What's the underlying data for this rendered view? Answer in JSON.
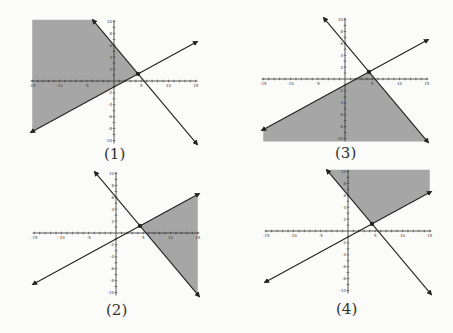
{
  "figure": {
    "graphs": [
      {
        "id": 1,
        "label": "(1)",
        "shaded_region": "left of descending line and above ascending line",
        "shade_color": "#a6a6a6"
      },
      {
        "id": 2,
        "label": "(2)",
        "shaded_region": "right of descending line and below ascending line (bounded by x=15)",
        "shade_color": "#a6a6a6"
      },
      {
        "id": 3,
        "label": "(3)",
        "shaded_region": "below both lines",
        "shade_color": "#a6a6a6"
      },
      {
        "id": 4,
        "label": "(4)",
        "shaded_region": "above both lines",
        "shade_color": "#a6a6a6"
      }
    ],
    "axes": {
      "x_ticks": [
        "-15",
        "-10",
        "-5",
        "5",
        "10",
        "15"
      ],
      "y_ticks": [
        "10",
        "8",
        "6",
        "4",
        "2",
        "-2",
        "-4",
        "-6",
        "-8",
        "-10"
      ],
      "xlim": [
        -15,
        15
      ],
      "ylim": [
        -10,
        10
      ]
    },
    "lines": [
      {
        "name": "descending",
        "y_intercept": 6,
        "x_intercept": 5.5
      },
      {
        "name": "ascending",
        "y_intercept": -1,
        "x_intercept": 2
      }
    ],
    "intersection": {
      "x": 4.4,
      "y": 1.2
    },
    "line_color": "#222222"
  }
}
